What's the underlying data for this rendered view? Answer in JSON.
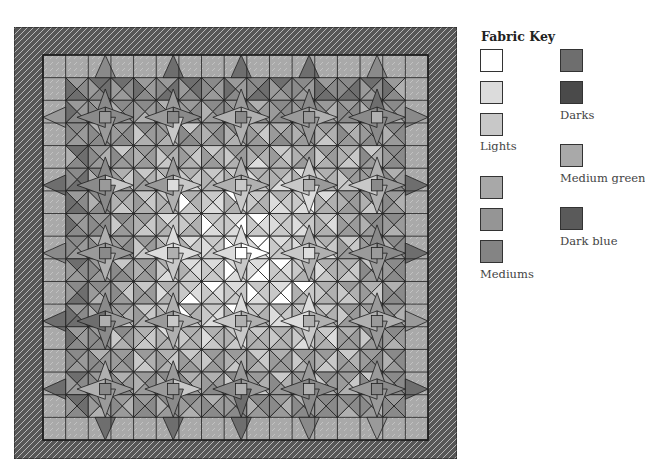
{
  "quilt": {
    "name": "Star quilt diagram",
    "outer_border": {
      "fabric": "Dark blue",
      "color": "#5a5a5a"
    },
    "inner_border": {
      "fabric": "Medium green",
      "color": "#a9a9a9"
    },
    "grid": {
      "inner_x": 29,
      "inner_y": 28,
      "inner_size": 385,
      "units": 34,
      "star_period_units": 6
    },
    "palette": {
      "white": "#ffffff",
      "light1": "#dcdcdc",
      "light2": "#c8c8c8",
      "medium1": "#b0b0b0",
      "medium2": "#9a9a9a",
      "medium3": "#8a8a8a",
      "dark1": "#6e6e6e",
      "dark2": "#4f4f4f",
      "green": "#a9a9a9",
      "blue": "#575757",
      "line": "#1e1e1e"
    }
  },
  "legend": {
    "title": "Fabric Key",
    "groups": [
      {
        "label": "Lights",
        "swatches": [
          "#ffffff",
          "#dcdcdc",
          "#c8c8c8"
        ]
      },
      {
        "label": "Mediums",
        "swatches": [
          "#a8a8a8",
          "#959595",
          "#848484"
        ]
      },
      {
        "label": "Darks",
        "swatches": [
          "#6e6e6e",
          "#4a4a4a"
        ]
      },
      {
        "label": "Medium green",
        "swatches": [
          "#a9a9a9"
        ]
      },
      {
        "label": "Dark blue",
        "swatches": [
          "#5a5a5a"
        ]
      }
    ]
  }
}
